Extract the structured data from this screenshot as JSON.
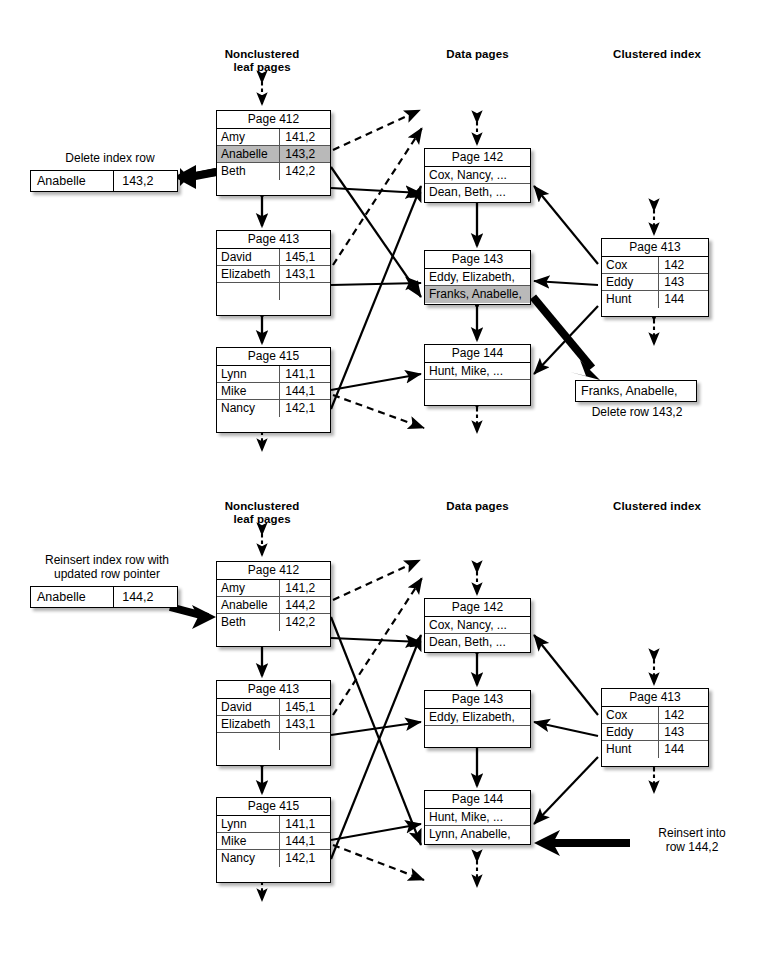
{
  "diagram": {
    "columns": {
      "nonclustered": "Nonclustered\nleaf pages",
      "nonclustered_line1": "Nonclustered",
      "nonclustered_line2": "leaf pages",
      "data_pages": "Data pages",
      "clustered_index": "Clustered index"
    }
  },
  "top": {
    "callout": {
      "label": "Delete index row",
      "key": "Anabelle",
      "value": "143,2"
    },
    "leaf_pages": [
      {
        "header": "Page 412",
        "rows": [
          {
            "key": "Amy",
            "value": "141,2",
            "highlight": false
          },
          {
            "key": "Anabelle",
            "value": "143,2",
            "highlight": true
          },
          {
            "key": "Beth",
            "value": "142,2",
            "highlight": false
          }
        ]
      },
      {
        "header": "Page 413",
        "rows": [
          {
            "key": "David",
            "value": "145,1",
            "highlight": false
          },
          {
            "key": "Elizabeth",
            "value": "143,1",
            "highlight": false
          },
          {
            "key": "",
            "value": "",
            "highlight": false
          }
        ]
      },
      {
        "header": "Page 415",
        "rows": [
          {
            "key": "Lynn",
            "value": "141,1",
            "highlight": false
          },
          {
            "key": "Mike",
            "value": "144,1",
            "highlight": false
          },
          {
            "key": "Nancy",
            "value": "142,1",
            "highlight": false
          }
        ]
      }
    ],
    "data_pages": [
      {
        "header": "Page 142",
        "rows": [
          {
            "text": "Cox, Nancy, ...",
            "highlight": false
          },
          {
            "text": "Dean, Beth, ...",
            "highlight": false
          }
        ]
      },
      {
        "header": "Page 143",
        "rows": [
          {
            "text": "Eddy, Elizabeth,",
            "highlight": false
          },
          {
            "text": "Franks, Anabelle,",
            "highlight": true
          }
        ]
      },
      {
        "header": "Page 144",
        "rows": [
          {
            "text": "Hunt, Mike, ...",
            "highlight": false
          },
          {
            "text": "",
            "highlight": false
          }
        ]
      }
    ],
    "clustered_index": {
      "header": "Page 413",
      "rows": [
        {
          "key": "Cox",
          "value": "142"
        },
        {
          "key": "Eddy",
          "value": "143"
        },
        {
          "key": "Hunt",
          "value": "144"
        }
      ]
    },
    "result_callout": {
      "row_text": "Franks, Anabelle,",
      "note": "Delete row 143,2"
    }
  },
  "bottom": {
    "callout": {
      "label_line1": "Reinsert index row with",
      "label_line2": "updated row pointer",
      "key": "Anabelle",
      "value": "144,2"
    },
    "leaf_pages": [
      {
        "header": "Page 412",
        "rows": [
          {
            "key": "Amy",
            "value": "141,2",
            "highlight": false
          },
          {
            "key": "Anabelle",
            "value": "144,2",
            "highlight": false
          },
          {
            "key": "Beth",
            "value": "142,2",
            "highlight": false
          }
        ]
      },
      {
        "header": "Page 413",
        "rows": [
          {
            "key": "David",
            "value": "145,1",
            "highlight": false
          },
          {
            "key": "Elizabeth",
            "value": "143,1",
            "highlight": false
          },
          {
            "key": "",
            "value": "",
            "highlight": false
          }
        ]
      },
      {
        "header": "Page 415",
        "rows": [
          {
            "key": "Lynn",
            "value": "141,1",
            "highlight": false
          },
          {
            "key": "Mike",
            "value": "144,1",
            "highlight": false
          },
          {
            "key": "Nancy",
            "value": "142,1",
            "highlight": false
          }
        ]
      }
    ],
    "data_pages": [
      {
        "header": "Page 142",
        "rows": [
          {
            "text": "Cox, Nancy, ...",
            "highlight": false
          },
          {
            "text": "Dean, Beth, ...",
            "highlight": false
          }
        ]
      },
      {
        "header": "Page 143",
        "rows": [
          {
            "text": "Eddy, Elizabeth,",
            "highlight": false
          },
          {
            "text": "",
            "highlight": false
          }
        ]
      },
      {
        "header": "Page 144",
        "rows": [
          {
            "text": "Hunt, Mike, ...",
            "highlight": false
          },
          {
            "text": "Lynn, Anabelle,",
            "highlight": false
          }
        ]
      }
    ],
    "clustered_index": {
      "header": "Page 413",
      "rows": [
        {
          "key": "Cox",
          "value": "142"
        },
        {
          "key": "Eddy",
          "value": "143"
        },
        {
          "key": "Hunt",
          "value": "144"
        }
      ]
    },
    "result_note": {
      "line1": "Reinsert into",
      "line2": "row 144,2"
    }
  },
  "colors": {
    "highlight": "#b9b9b9",
    "line": "#000000",
    "background": "#ffffff"
  }
}
